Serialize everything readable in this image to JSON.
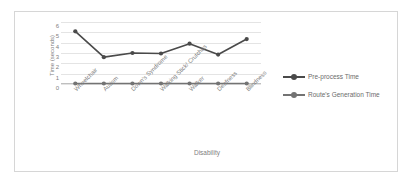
{
  "chart_data": {
    "type": "line",
    "title": "",
    "xlabel": "Disability",
    "ylabel": "Time (seconds)",
    "categories": [
      "Wheelchair",
      "Autism",
      "Down's Syndrome",
      "Walking Stick/ Crutches",
      "Walker",
      "Deafness",
      "Blindness"
    ],
    "series": [
      {
        "name": "Pre-process Time",
        "values": [
          5.1,
          2.6,
          3.0,
          2.95,
          3.9,
          2.85,
          4.35
        ],
        "color": "#4a4a4a"
      },
      {
        "name": "Route's Generation Time",
        "values": [
          0.05,
          0.05,
          0.05,
          0.05,
          0.05,
          0.05,
          0.05
        ],
        "color": "#737373"
      }
    ],
    "ylim": [
      0,
      6
    ],
    "yticks": [
      "6",
      "5",
      "4",
      "3",
      "2",
      "1",
      "0"
    ],
    "grid": true,
    "legend_position": "right"
  },
  "axes": {
    "y_title": "Time (seconds)",
    "x_title": "Disability"
  },
  "legend": {
    "entries": [
      {
        "label": "Pre-process Time"
      },
      {
        "label": "Route's Generation Time"
      }
    ]
  },
  "colors": {
    "series1": "#4a4a4a",
    "series2": "#737373",
    "gridline": "#e4e4e4",
    "border": "#d6d6d6",
    "text": "#808080"
  }
}
